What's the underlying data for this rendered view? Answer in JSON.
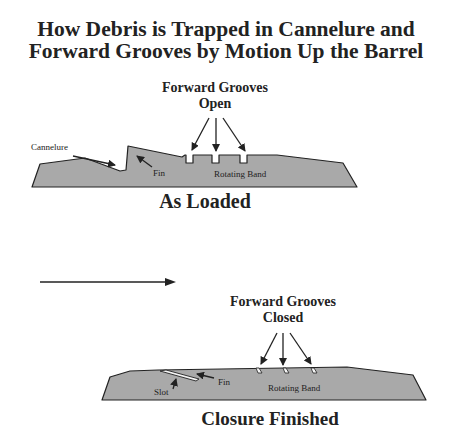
{
  "title": {
    "line1": "How Debris is Trapped in Cannelure and",
    "line2": "Forward Grooves by Motion Up the Barrel"
  },
  "top_diagram": {
    "grooves_label_line1": "Forward Grooves",
    "grooves_label_line2": "Open",
    "cannelure_label": "Cannelure",
    "fin_label": "Fin",
    "band_label": "Rotating Band",
    "caption": "As Loaded"
  },
  "motion_arrow": {
    "direction": "right"
  },
  "bottom_diagram": {
    "grooves_label_line1": "Forward Grooves",
    "grooves_label_line2": "Closed",
    "slot_label": "Slot",
    "fin_label": "Fin",
    "band_label": "Rotating Band",
    "caption": "Closure Finished"
  },
  "colors": {
    "shape_fill": "#a9a9a9",
    "outline": "#222222",
    "background": "#ffffff"
  }
}
